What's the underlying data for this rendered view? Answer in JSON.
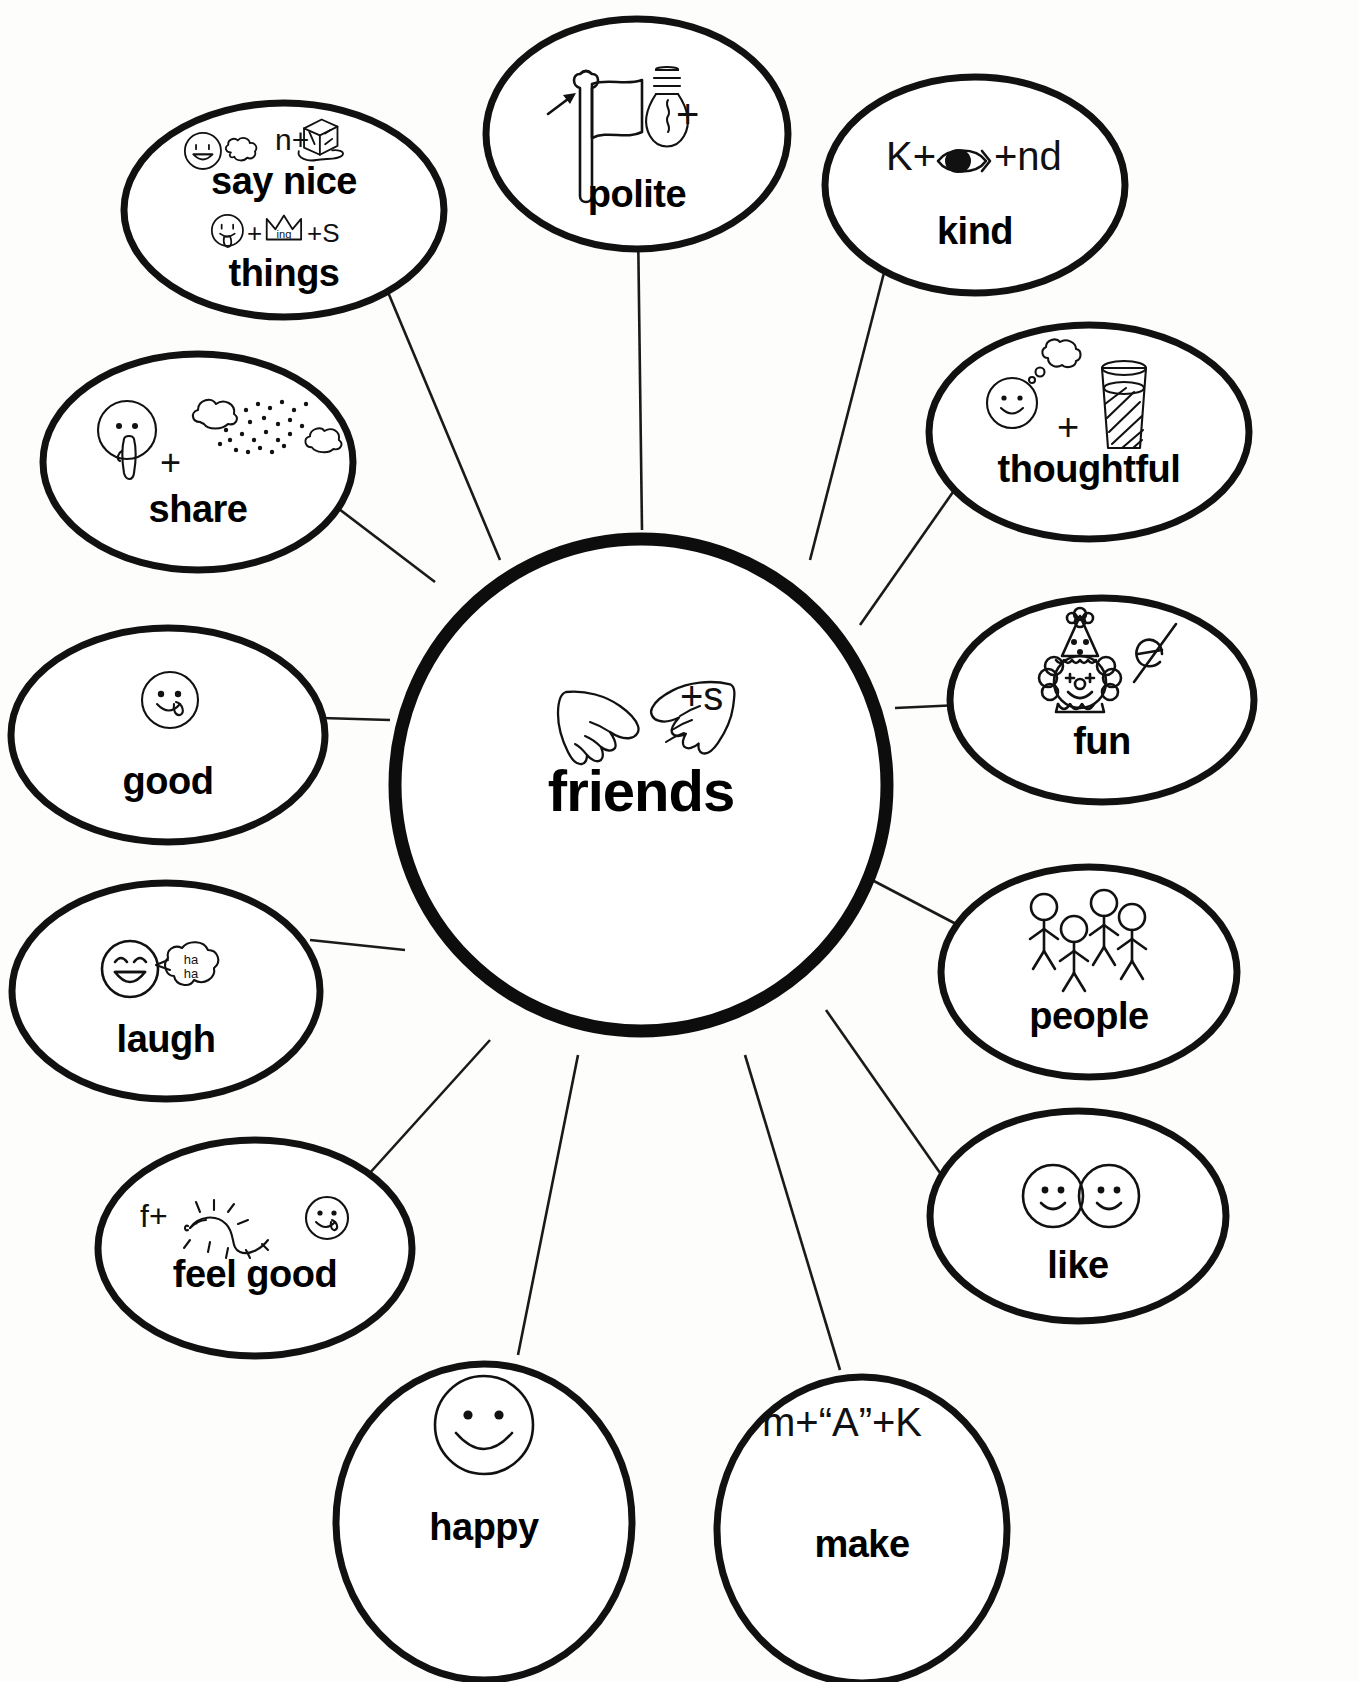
{
  "worksheet": {
    "type": "word-web",
    "center": {
      "word": "friends",
      "rebus": "+s",
      "rebus_icons": [
        "two-hands-reaching-icon"
      ]
    },
    "margin_note": "",
    "colors": {
      "ink": "#000000",
      "paper": "#fdfdfc",
      "line": "#1a1a1a"
    },
    "nodes": [
      {
        "id": "say-nice-things",
        "label_line1": "say nice",
        "label_line2": "things",
        "label": "say nice things",
        "rebus_row1_text": "n+",
        "rebus_row2_text": "+",
        "rebus_row2_text2": "+S",
        "rebus_icons": [
          "smiley-say-face-icon",
          "speech-cloud-icon",
          "ice-cube-icon",
          "tongue-out-face-icon",
          "ing-crown-icon"
        ]
      },
      {
        "id": "polite",
        "label": "polite",
        "rebus_text": "+",
        "rebus_icons": [
          "arrow-icon",
          "flag-pole-icon",
          "light-bulb-icon"
        ]
      },
      {
        "id": "kind",
        "label": "kind",
        "rebus_text_before": "K+",
        "rebus_text_after": "+nd",
        "rebus_icons": [
          "eye-icon"
        ]
      },
      {
        "id": "thoughtful",
        "label": "thoughtful",
        "rebus_text": "+",
        "rebus_icons": [
          "thinking-face-icon",
          "thought-bubble-icon",
          "full-glass-icon"
        ]
      },
      {
        "id": "fun",
        "label": "fun",
        "rebus_text": "",
        "rebus_icons": [
          "clown-face-icon",
          "crossed-out-e-icon"
        ]
      },
      {
        "id": "people",
        "label": "people",
        "rebus_text": "",
        "rebus_icons": [
          "four-stick-figures-icon"
        ]
      },
      {
        "id": "like",
        "label": "like",
        "rebus_text": "",
        "rebus_icons": [
          "two-smiley-faces-icon"
        ]
      },
      {
        "id": "make",
        "label": "make",
        "rebus_text": "m+“A”+K",
        "rebus_icons": []
      },
      {
        "id": "happy",
        "label": "happy",
        "rebus_text": "",
        "rebus_icons": [
          "big-smiley-face-icon"
        ]
      },
      {
        "id": "feel-good",
        "label": "feel good",
        "rebus_text": "f+",
        "rebus_icons": [
          "glowing-eel-icon",
          "licking-lips-face-icon"
        ]
      },
      {
        "id": "laugh",
        "label": "laugh",
        "rebus_text": "",
        "rebus_icons": [
          "laughing-face-icon",
          "ha-ha-speech-bubble-icon"
        ]
      },
      {
        "id": "good",
        "label": "good",
        "rebus_text": "",
        "rebus_icons": [
          "licking-lips-face-icon"
        ]
      },
      {
        "id": "share",
        "label": "share",
        "rebus_text": "+",
        "rebus_icons": [
          "shh-face-icon",
          "air-clouds-icon"
        ]
      }
    ]
  }
}
